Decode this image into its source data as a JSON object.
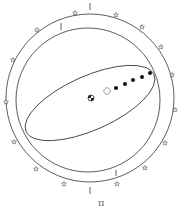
{
  "figure": {
    "caption": "II",
    "stroke_color": "#333333",
    "background": "#ffffff"
  },
  "diagram": {
    "outer_ring": {
      "label": "sphere-of-fixed-stars",
      "star_count": 14
    },
    "inner_ring": {
      "label": "celestial-sphere"
    },
    "ecliptic": {
      "label": "ecliptic-ellipse"
    },
    "bodies": [
      {
        "name": "earth",
        "symbol": "earth-icon"
      },
      {
        "name": "moon",
        "symbol": "crescent-moon-icon"
      },
      {
        "name": "sun",
        "symbol": "sun-icon"
      },
      {
        "name": "planet-1",
        "symbol": "dot"
      },
      {
        "name": "planet-2",
        "symbol": "dot"
      },
      {
        "name": "planet-3",
        "symbol": "dot"
      },
      {
        "name": "planet-4",
        "symbol": "dot"
      },
      {
        "name": "planet-5",
        "symbol": "dot"
      }
    ]
  }
}
